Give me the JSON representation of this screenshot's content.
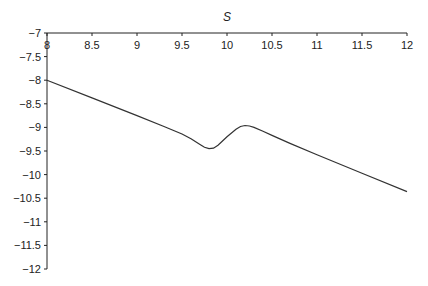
{
  "chart_data": {
    "type": "line",
    "title": "S",
    "xlabel": "",
    "ylabel": "",
    "xlim": [
      8,
      12
    ],
    "ylim": [
      -12,
      -7
    ],
    "x_axis_position": "top",
    "grid": false,
    "legend": null,
    "x_ticks": [
      "8",
      "8.5",
      "9",
      "9.5",
      "10",
      "10.5",
      "11",
      "11.5",
      "12"
    ],
    "y_ticks": [
      "-7",
      "-7.5",
      "-8",
      "-8.5",
      "-9",
      "-9.5",
      "-10",
      "-10.5",
      "-11",
      "-11.5",
      "-12"
    ],
    "series": [
      {
        "name": "S",
        "color": "#333333",
        "x": [
          8.0,
          8.5,
          9.0,
          9.3,
          9.5,
          9.6,
          9.7,
          9.75,
          9.8,
          9.85,
          9.9,
          10.0,
          10.1,
          10.15,
          10.2,
          10.25,
          10.3,
          10.4,
          10.5,
          10.7,
          11.0,
          11.5,
          12.0
        ],
        "y": [
          -8.0,
          -8.375,
          -8.75,
          -8.98,
          -9.14,
          -9.24,
          -9.36,
          -9.42,
          -9.45,
          -9.44,
          -9.38,
          -9.2,
          -9.04,
          -8.98,
          -8.96,
          -8.97,
          -9.0,
          -9.08,
          -9.17,
          -9.34,
          -9.58,
          -9.97,
          -10.36
        ]
      }
    ]
  }
}
